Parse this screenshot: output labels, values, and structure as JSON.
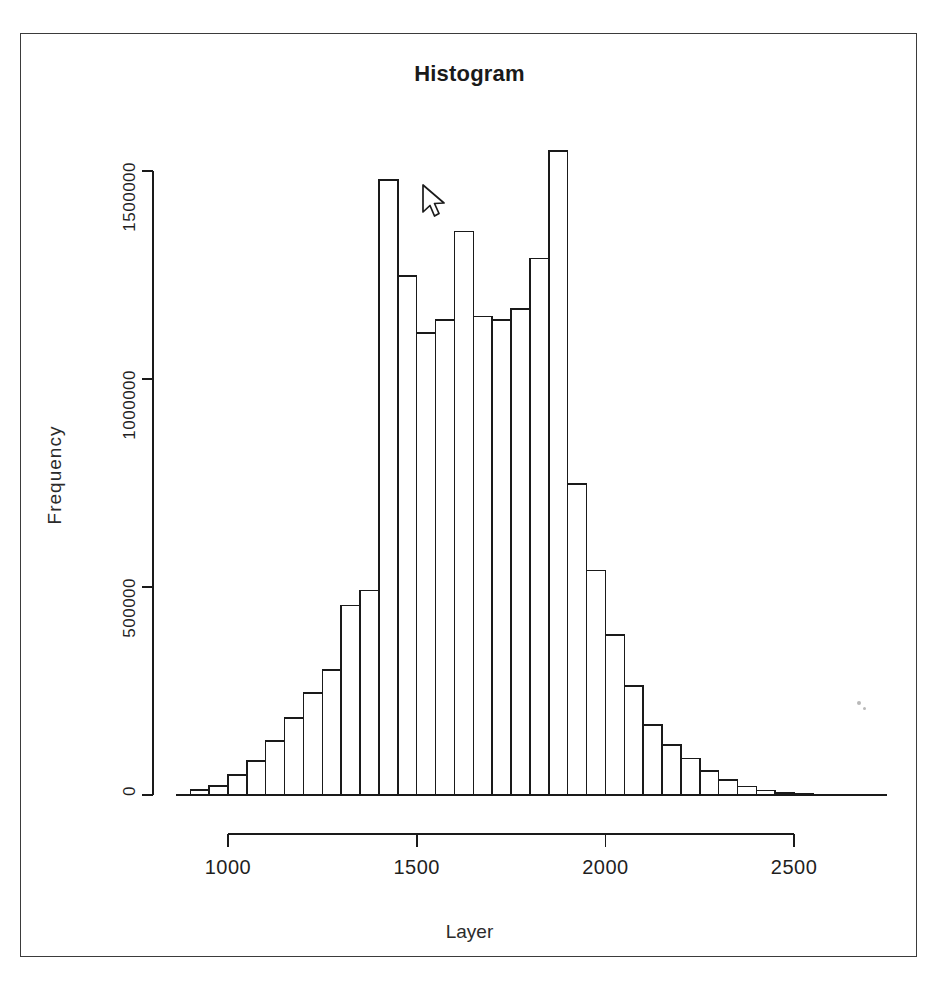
{
  "page": {
    "top_text_fragment": "",
    "background_color": "#ffffff",
    "frame_color": "#3b3b3b"
  },
  "chart_data": {
    "type": "bar",
    "title": "Histogram",
    "xlabel": "Layer",
    "ylabel": "Frequency",
    "grid": false,
    "legend": null,
    "ink_color": "#1a1a1a",
    "fill_color": "#ffffff",
    "xlim": [
      875,
      2625
    ],
    "ylim": [
      0,
      1620000
    ],
    "bin_width": 50,
    "xticks": [
      1000,
      1500,
      2000,
      2500
    ],
    "xtick_labels": [
      "1000",
      "1500",
      "2000",
      "2500"
    ],
    "yticks": [
      0,
      500000,
      1000000,
      1500000
    ],
    "ytick_labels": [
      "0",
      "500000",
      "1000000",
      "1500000"
    ],
    "bin_starts": [
      900,
      950,
      1000,
      1050,
      1100,
      1150,
      1200,
      1250,
      1300,
      1350,
      1400,
      1450,
      1500,
      1550,
      1600,
      1650,
      1700,
      1750,
      1800,
      1850,
      1900,
      1950,
      2000,
      2050,
      2100,
      2150,
      2200,
      2250,
      2300,
      2350,
      2400,
      2450,
      2500
    ],
    "values": [
      12000,
      22000,
      48000,
      82000,
      130000,
      185000,
      245000,
      300000,
      455000,
      492000,
      1478000,
      1248000,
      1110000,
      1142000,
      1355000,
      1150000,
      1142000,
      1168000,
      1290000,
      1548000,
      748000,
      540000,
      385000,
      262000,
      168000,
      120000,
      88000,
      58000,
      36000,
      20000,
      11000,
      5000,
      2000
    ],
    "peak_bin": 1850,
    "peak_value": 1548000,
    "categories": [
      "900-950",
      "950-1000",
      "1000-1050",
      "1050-1100",
      "1100-1150",
      "1150-1200",
      "1200-1250",
      "1250-1300",
      "1300-1350",
      "1350-1400",
      "1400-1450",
      "1450-1500",
      "1500-1550",
      "1550-1600",
      "1600-1650",
      "1650-1700",
      "1700-1750",
      "1750-1800",
      "1800-1850",
      "1850-1900",
      "1900-1950",
      "1950-2000",
      "2000-2050",
      "2050-2100",
      "2100-2150",
      "2150-2200",
      "2200-2250",
      "2250-2300",
      "2300-2350",
      "2350-2400",
      "2400-2450",
      "2450-2500",
      "2500-2550"
    ]
  },
  "cursor": {
    "icon": "mouse-pointer-arrow",
    "x": 420,
    "y": 185
  }
}
